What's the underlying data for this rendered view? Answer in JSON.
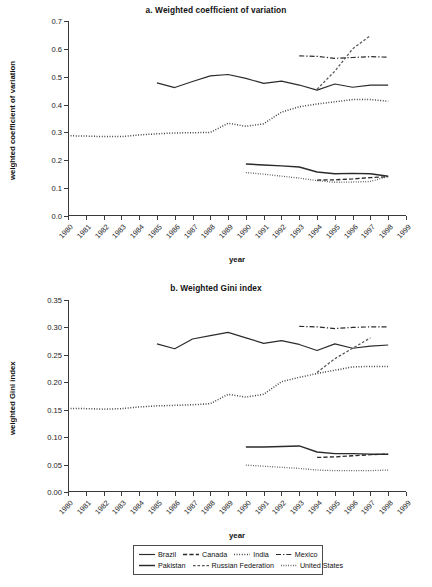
{
  "figure": {
    "x_axis_label": "year",
    "years": [
      "1980",
      "1981",
      "1982",
      "1983",
      "1984",
      "1985",
      "1986",
      "1987",
      "1988",
      "1989",
      "1990",
      "1991",
      "1992",
      "1993",
      "1994",
      "1995",
      "1996",
      "1997",
      "1998",
      "1999"
    ]
  },
  "legend": {
    "rows": [
      [
        {
          "label": "Brazil",
          "style": "solid"
        },
        {
          "label": "Canada",
          "style": "dashed"
        },
        {
          "label": "India",
          "style": "dotted"
        },
        {
          "label": "Mexico",
          "style": "dashdot"
        }
      ],
      [
        {
          "label": "Pakistan",
          "style": "solid-thick"
        },
        {
          "label": "Russian Federation",
          "style": "dashed-fine"
        },
        {
          "label": "United States",
          "style": "dotted-fine"
        }
      ]
    ]
  },
  "chart_data": [
    {
      "type": "line",
      "id": "panel-a",
      "title": "a. Weighted coefficient of variation",
      "xlabel": "year",
      "ylabel": "weighted coefficient of variation",
      "x": [
        "1980",
        "1981",
        "1982",
        "1983",
        "1984",
        "1985",
        "1986",
        "1987",
        "1988",
        "1989",
        "1990",
        "1991",
        "1992",
        "1993",
        "1994",
        "1995",
        "1996",
        "1997",
        "1998",
        "1999"
      ],
      "xlim": [
        "1980",
        "1999"
      ],
      "ylim": [
        0.0,
        0.7
      ],
      "yticks": [
        "0.0",
        "0.1",
        "0.2",
        "0.3",
        "0.4",
        "0.5",
        "0.6",
        "0.7"
      ],
      "grid": false,
      "legend_position": "below-figure",
      "series": [
        {
          "name": "Brazil",
          "style": "solid",
          "points": [
            [
              "1985",
              0.478
            ],
            [
              "1986",
              0.461
            ],
            [
              "1987",
              0.483
            ],
            [
              "1988",
              0.503
            ],
            [
              "1989",
              0.508
            ],
            [
              "1990",
              0.494
            ],
            [
              "1991",
              0.476
            ],
            [
              "1992",
              0.484
            ],
            [
              "1993",
              0.47
            ],
            [
              "1994",
              0.452
            ],
            [
              "1995",
              0.474
            ],
            [
              "1996",
              0.462
            ],
            [
              "1997",
              0.47
            ],
            [
              "1998",
              0.47
            ]
          ]
        },
        {
          "name": "Canada",
          "style": "dashed",
          "points": [
            [
              "1994",
              0.129
            ],
            [
              "1995",
              0.13
            ],
            [
              "1996",
              0.133
            ],
            [
              "1997",
              0.138
            ],
            [
              "1998",
              0.141
            ]
          ]
        },
        {
          "name": "India",
          "style": "dotted",
          "points": [
            [
              "1980",
              0.288
            ],
            [
              "1981",
              0.287
            ],
            [
              "1982",
              0.285
            ],
            [
              "1983",
              0.285
            ],
            [
              "1984",
              0.291
            ],
            [
              "1985",
              0.295
            ],
            [
              "1986",
              0.298
            ],
            [
              "1987",
              0.299
            ],
            [
              "1988",
              0.3
            ],
            [
              "1989",
              0.333
            ],
            [
              "1990",
              0.322
            ],
            [
              "1991",
              0.331
            ],
            [
              "1992",
              0.373
            ],
            [
              "1993",
              0.392
            ],
            [
              "1994",
              0.402
            ],
            [
              "1995",
              0.41
            ],
            [
              "1996",
              0.418
            ],
            [
              "1997",
              0.418
            ],
            [
              "1998",
              0.412
            ]
          ]
        },
        {
          "name": "Mexico",
          "style": "dashdot",
          "points": [
            [
              "1993",
              0.575
            ],
            [
              "1994",
              0.573
            ],
            [
              "1995",
              0.566
            ],
            [
              "1996",
              0.569
            ],
            [
              "1997",
              0.572
            ],
            [
              "1998",
              0.57
            ]
          ]
        },
        {
          "name": "Pakistan",
          "style": "solid-thick",
          "points": [
            [
              "1990",
              0.187
            ],
            [
              "1991",
              0.183
            ],
            [
              "1992",
              0.18
            ],
            [
              "1993",
              0.176
            ],
            [
              "1994",
              0.158
            ],
            [
              "1995",
              0.152
            ],
            [
              "1996",
              0.153
            ],
            [
              "1997",
              0.152
            ],
            [
              "1998",
              0.143
            ]
          ]
        },
        {
          "name": "Russian Federation",
          "style": "dashed-fine",
          "points": [
            [
              "1994",
              0.455
            ],
            [
              "1995",
              0.52
            ],
            [
              "1996",
              0.6
            ],
            [
              "1997",
              0.648
            ]
          ]
        },
        {
          "name": "United States",
          "style": "dotted-fine",
          "points": [
            [
              "1990",
              0.156
            ],
            [
              "1991",
              0.15
            ],
            [
              "1992",
              0.143
            ],
            [
              "1993",
              0.136
            ],
            [
              "1994",
              0.127
            ],
            [
              "1995",
              0.121
            ],
            [
              "1996",
              0.122
            ],
            [
              "1997",
              0.124
            ],
            [
              "1998",
              0.142
            ]
          ]
        }
      ]
    },
    {
      "type": "line",
      "id": "panel-b",
      "title": "b. Weighted Gini index",
      "xlabel": "year",
      "ylabel": "weighted Gini index",
      "x": [
        "1980",
        "1981",
        "1982",
        "1983",
        "1984",
        "1985",
        "1986",
        "1987",
        "1988",
        "1989",
        "1990",
        "1991",
        "1992",
        "1993",
        "1994",
        "1995",
        "1996",
        "1997",
        "1998",
        "1999"
      ],
      "xlim": [
        "1980",
        "1999"
      ],
      "ylim": [
        0.0,
        0.35
      ],
      "yticks": [
        "0.00",
        "0.05",
        "0.10",
        "0.15",
        "0.20",
        "0.25",
        "0.30",
        "0.35"
      ],
      "grid": false,
      "legend_position": "below-figure",
      "series": [
        {
          "name": "Brazil",
          "style": "solid",
          "points": [
            [
              "1985",
              0.27
            ],
            [
              "1986",
              0.261
            ],
            [
              "1987",
              0.279
            ],
            [
              "1988",
              0.285
            ],
            [
              "1989",
              0.291
            ],
            [
              "1990",
              0.281
            ],
            [
              "1991",
              0.271
            ],
            [
              "1992",
              0.276
            ],
            [
              "1993",
              0.269
            ],
            [
              "1994",
              0.258
            ],
            [
              "1995",
              0.27
            ],
            [
              "1996",
              0.262
            ],
            [
              "1997",
              0.266
            ],
            [
              "1998",
              0.268
            ]
          ]
        },
        {
          "name": "Canada",
          "style": "dashed",
          "points": [
            [
              "1994",
              0.063
            ],
            [
              "1995",
              0.064
            ],
            [
              "1996",
              0.066
            ],
            [
              "1997",
              0.068
            ],
            [
              "1998",
              0.069
            ]
          ]
        },
        {
          "name": "India",
          "style": "dotted",
          "points": [
            [
              "1980",
              0.152
            ],
            [
              "1981",
              0.152
            ],
            [
              "1982",
              0.151
            ],
            [
              "1983",
              0.152
            ],
            [
              "1984",
              0.155
            ],
            [
              "1985",
              0.157
            ],
            [
              "1986",
              0.158
            ],
            [
              "1987",
              0.159
            ],
            [
              "1988",
              0.161
            ],
            [
              "1989",
              0.178
            ],
            [
              "1990",
              0.173
            ],
            [
              "1991",
              0.178
            ],
            [
              "1992",
              0.201
            ],
            [
              "1993",
              0.209
            ],
            [
              "1994",
              0.216
            ],
            [
              "1995",
              0.222
            ],
            [
              "1996",
              0.228
            ],
            [
              "1997",
              0.229
            ],
            [
              "1998",
              0.229
            ]
          ]
        },
        {
          "name": "Mexico",
          "style": "dashdot",
          "points": [
            [
              "1993",
              0.302
            ],
            [
              "1994",
              0.301
            ],
            [
              "1995",
              0.298
            ],
            [
              "1996",
              0.3
            ],
            [
              "1997",
              0.301
            ],
            [
              "1998",
              0.301
            ]
          ]
        },
        {
          "name": "Pakistan",
          "style": "solid-thick",
          "points": [
            [
              "1990",
              0.082
            ],
            [
              "1991",
              0.082
            ],
            [
              "1992",
              0.083
            ],
            [
              "1993",
              0.084
            ],
            [
              "1994",
              0.073
            ],
            [
              "1995",
              0.07
            ],
            [
              "1996",
              0.07
            ],
            [
              "1997",
              0.069
            ],
            [
              "1998",
              0.069
            ]
          ]
        },
        {
          "name": "Russian Federation",
          "style": "dashed-fine",
          "points": [
            [
              "1994",
              0.218
            ],
            [
              "1995",
              0.243
            ],
            [
              "1996",
              0.262
            ],
            [
              "1997",
              0.281
            ]
          ]
        },
        {
          "name": "United States",
          "style": "dotted-fine",
          "points": [
            [
              "1990",
              0.049
            ],
            [
              "1991",
              0.047
            ],
            [
              "1992",
              0.045
            ],
            [
              "1993",
              0.043
            ],
            [
              "1994",
              0.04
            ],
            [
              "1995",
              0.039
            ],
            [
              "1996",
              0.039
            ],
            [
              "1997",
              0.039
            ],
            [
              "1998",
              0.04
            ]
          ]
        }
      ]
    }
  ]
}
